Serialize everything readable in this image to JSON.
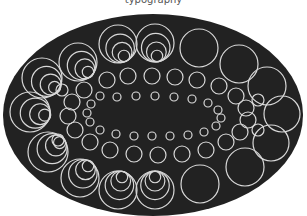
{
  "caption": "typography",
  "colors": {
    "background": "#ffffff",
    "ellipse": "#222222",
    "stroke": "#d8d8d8"
  },
  "ellipse": {
    "cx": 153,
    "cy": 115,
    "rx": 150,
    "ry": 101
  },
  "nested_groups": [
    {
      "cx": 78,
      "cy": 62,
      "r": 19,
      "dx": 1.0,
      "dy": 1.0
    },
    {
      "cx": 118,
      "cy": 44,
      "r": 19,
      "dx": 0.6,
      "dy": 1.2
    },
    {
      "cx": 155,
      "cy": 43,
      "r": 19,
      "dx": 0.2,
      "dy": 1.3
    },
    {
      "cx": 42,
      "cy": 78,
      "r": 20,
      "dx": 1.2,
      "dy": 0.9
    },
    {
      "cx": 30,
      "cy": 112,
      "r": 20,
      "dx": 1.4,
      "dy": 0.3
    },
    {
      "cx": 48,
      "cy": 152,
      "r": 20,
      "dx": 1.1,
      "dy": -0.9
    },
    {
      "cx": 80,
      "cy": 178,
      "r": 19,
      "dx": 0.8,
      "dy": -1.2
    },
    {
      "cx": 118,
      "cy": 190,
      "r": 19,
      "dx": 0.4,
      "dy": -1.3
    },
    {
      "cx": 155,
      "cy": 190,
      "r": 19,
      "dx": 0.0,
      "dy": -1.3
    }
  ],
  "single_circles": [
    {
      "cx": 199,
      "cy": 48,
      "r": 19
    },
    {
      "cx": 239,
      "cy": 64,
      "r": 19
    },
    {
      "cx": 267,
      "cy": 86,
      "r": 19
    },
    {
      "cx": 282,
      "cy": 114,
      "r": 18
    },
    {
      "cx": 271,
      "cy": 143,
      "r": 18
    },
    {
      "cx": 245,
      "cy": 167,
      "r": 19
    },
    {
      "cx": 200,
      "cy": 184,
      "r": 19
    },
    {
      "cx": 107,
      "cy": 80,
      "r": 8
    },
    {
      "cx": 128,
      "cy": 76,
      "r": 8
    },
    {
      "cx": 152,
      "cy": 76,
      "r": 8
    },
    {
      "cx": 175,
      "cy": 77,
      "r": 8
    },
    {
      "cx": 197,
      "cy": 80,
      "r": 8
    },
    {
      "cx": 219,
      "cy": 86,
      "r": 8
    },
    {
      "cx": 236,
      "cy": 96,
      "r": 8
    },
    {
      "cx": 246,
      "cy": 108,
      "r": 8
    },
    {
      "cx": 248,
      "cy": 120,
      "r": 8
    },
    {
      "cx": 240,
      "cy": 132,
      "r": 8
    },
    {
      "cx": 226,
      "cy": 142,
      "r": 8
    },
    {
      "cx": 206,
      "cy": 150,
      "r": 8
    },
    {
      "cx": 182,
      "cy": 154,
      "r": 8
    },
    {
      "cx": 158,
      "cy": 155,
      "r": 8
    },
    {
      "cx": 134,
      "cy": 154,
      "r": 8
    },
    {
      "cx": 110,
      "cy": 150,
      "r": 8
    },
    {
      "cx": 90,
      "cy": 142,
      "r": 8
    },
    {
      "cx": 75,
      "cy": 130,
      "r": 8
    },
    {
      "cx": 68,
      "cy": 116,
      "r": 8
    },
    {
      "cx": 72,
      "cy": 102,
      "r": 8
    },
    {
      "cx": 84,
      "cy": 90,
      "r": 8
    },
    {
      "cx": 100,
      "cy": 96,
      "r": 4
    },
    {
      "cx": 117,
      "cy": 97,
      "r": 4
    },
    {
      "cx": 136,
      "cy": 96,
      "r": 4
    },
    {
      "cx": 155,
      "cy": 96,
      "r": 4
    },
    {
      "cx": 174,
      "cy": 97,
      "r": 4
    },
    {
      "cx": 192,
      "cy": 99,
      "r": 4
    },
    {
      "cx": 208,
      "cy": 103,
      "r": 4
    },
    {
      "cx": 218,
      "cy": 110,
      "r": 4
    },
    {
      "cx": 221,
      "cy": 118,
      "r": 4
    },
    {
      "cx": 216,
      "cy": 126,
      "r": 4
    },
    {
      "cx": 204,
      "cy": 132,
      "r": 4
    },
    {
      "cx": 188,
      "cy": 135,
      "r": 4
    },
    {
      "cx": 170,
      "cy": 136,
      "r": 4
    },
    {
      "cx": 152,
      "cy": 136,
      "r": 4
    },
    {
      "cx": 134,
      "cy": 136,
      "r": 4
    },
    {
      "cx": 116,
      "cy": 134,
      "r": 4
    },
    {
      "cx": 100,
      "cy": 130,
      "r": 4
    },
    {
      "cx": 90,
      "cy": 122,
      "r": 4
    },
    {
      "cx": 87,
      "cy": 113,
      "r": 4
    },
    {
      "cx": 91,
      "cy": 104,
      "r": 4
    },
    {
      "cx": 62,
      "cy": 90,
      "r": 6
    },
    {
      "cx": 58,
      "cy": 140,
      "r": 6
    },
    {
      "cx": 258,
      "cy": 100,
      "r": 6
    },
    {
      "cx": 258,
      "cy": 130,
      "r": 6
    }
  ]
}
